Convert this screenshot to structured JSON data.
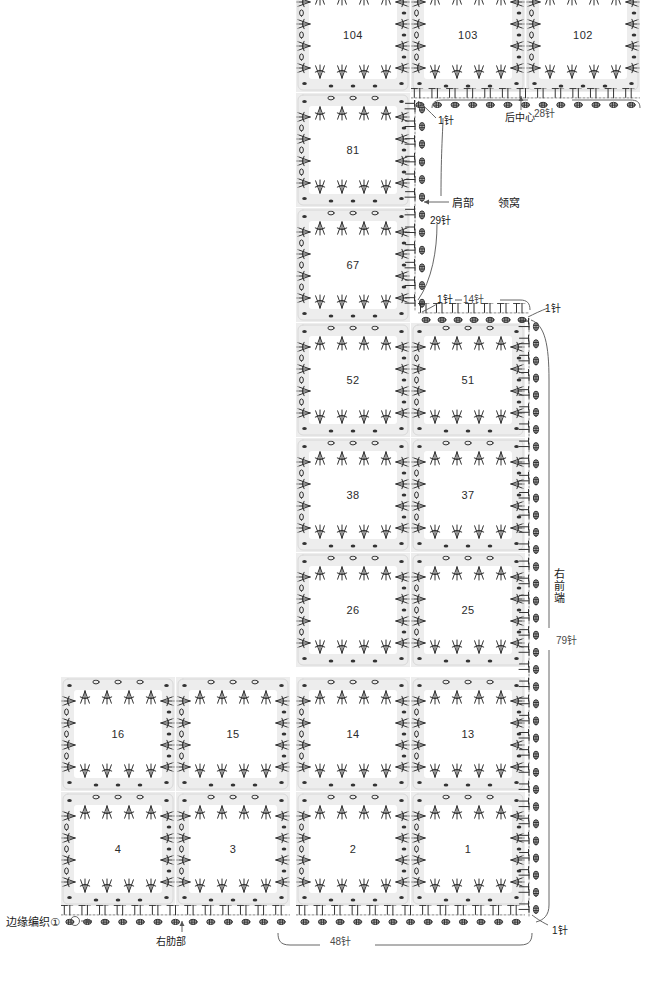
{
  "diagram": {
    "background": "#ffffff",
    "motif_band_color": "#ededed",
    "stitch_ink": "#333333"
  },
  "motifs": [
    {
      "id": "m104",
      "label": "104",
      "x": 296,
      "y": -22,
      "w": 114,
      "h": 114,
      "clip_top": true
    },
    {
      "id": "m103",
      "label": "103",
      "x": 411,
      "y": -22,
      "w": 114,
      "h": 114,
      "clip_top": true
    },
    {
      "id": "m102",
      "label": "102",
      "x": 526,
      "y": -22,
      "w": 114,
      "h": 114,
      "clip_top": true
    },
    {
      "id": "m81",
      "label": "81",
      "x": 296,
      "y": 93,
      "w": 114,
      "h": 114,
      "clip_top": false
    },
    {
      "id": "m67",
      "label": "67",
      "x": 296,
      "y": 208,
      "w": 114,
      "h": 114,
      "clip_top": false
    },
    {
      "id": "m52",
      "label": "52",
      "x": 296,
      "y": 323,
      "w": 114,
      "h": 114,
      "clip_top": false
    },
    {
      "id": "m51",
      "label": "51",
      "x": 411,
      "y": 323,
      "w": 114,
      "h": 114,
      "clip_top": false
    },
    {
      "id": "m38",
      "label": "38",
      "x": 296,
      "y": 438,
      "w": 114,
      "h": 114,
      "clip_top": false
    },
    {
      "id": "m37",
      "label": "37",
      "x": 411,
      "y": 438,
      "w": 114,
      "h": 114,
      "clip_top": false
    },
    {
      "id": "m26",
      "label": "26",
      "x": 296,
      "y": 553,
      "w": 114,
      "h": 114,
      "clip_top": false
    },
    {
      "id": "m25",
      "label": "25",
      "x": 411,
      "y": 553,
      "w": 114,
      "h": 114,
      "clip_top": false
    },
    {
      "id": "m16",
      "label": "16",
      "x": 61,
      "y": 677,
      "w": 114,
      "h": 114,
      "clip_top": false
    },
    {
      "id": "m15",
      "label": "15",
      "x": 176,
      "y": 677,
      "w": 114,
      "h": 114,
      "clip_top": false
    },
    {
      "id": "m14",
      "label": "14",
      "x": 296,
      "y": 677,
      "w": 114,
      "h": 114,
      "clip_top": false
    },
    {
      "id": "m13",
      "label": "13",
      "x": 411,
      "y": 677,
      "w": 114,
      "h": 114,
      "clip_top": false
    },
    {
      "id": "m4",
      "label": "4",
      "x": 61,
      "y": 792,
      "w": 114,
      "h": 114,
      "clip_top": false
    },
    {
      "id": "m3",
      "label": "3",
      "x": 176,
      "y": 792,
      "w": 114,
      "h": 114,
      "clip_top": false
    },
    {
      "id": "m2",
      "label": "2",
      "x": 296,
      "y": 792,
      "w": 114,
      "h": 114,
      "clip_top": false
    },
    {
      "id": "m1",
      "label": "1",
      "x": 411,
      "y": 792,
      "w": 114,
      "h": 114,
      "clip_top": false
    }
  ],
  "edge_bands": [
    {
      "id": "neck-top",
      "orientation": "horizontal",
      "x": 411,
      "y": 88,
      "w": 229,
      "h": 22
    },
    {
      "id": "shoulder-left-vertical",
      "orientation": "vertical",
      "x": 404,
      "y": 100,
      "w": 22,
      "h": 212
    },
    {
      "id": "front-neck-horizontal",
      "orientation": "horizontal",
      "x": 418,
      "y": 303,
      "w": 112,
      "h": 22
    },
    {
      "id": "right-front-vertical",
      "orientation": "vertical",
      "x": 518,
      "y": 318,
      "w": 22,
      "h": 600
    },
    {
      "id": "bottom-left-horizontal",
      "orientation": "horizontal",
      "x": 61,
      "y": 905,
      "w": 229,
      "h": 22
    },
    {
      "id": "bottom-right-horizontal",
      "orientation": "horizontal",
      "x": 296,
      "y": 905,
      "w": 229,
      "h": 22
    }
  ],
  "annotations": {
    "edge_knit_label": "边缘编织①",
    "right_rib_label": "右肋部",
    "back_center_label": "后中心",
    "shoulder_label": "肩部",
    "neckline_label": "领窝",
    "right_front_label": "右前端",
    "stitch_counts": {
      "back_28": "28针",
      "one_a": "1针",
      "shoulder_29": "29针",
      "one_b": "1针",
      "front_14": "14针",
      "one_c": "1针",
      "right_front_79": "79针",
      "bottom_48": "48针",
      "one_d": "1针"
    }
  }
}
